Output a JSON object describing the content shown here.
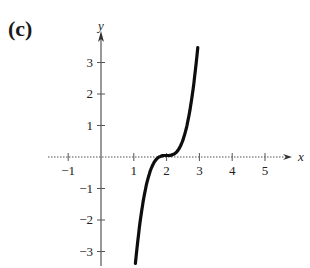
{
  "panel": {
    "label": "(c)"
  },
  "chart_data": {
    "type": "line",
    "title": "",
    "xlabel": "x",
    "ylabel": "y",
    "xlim": [
      -1.2,
      5.8
    ],
    "ylim": [
      -3.4,
      3.6
    ],
    "x_ticks": [
      -1,
      1,
      2,
      3,
      4,
      5
    ],
    "x_tick_labels": [
      "−1",
      "1",
      "2",
      "3",
      "4",
      "5"
    ],
    "y_ticks": [
      -3,
      -2,
      -1,
      1,
      2,
      3
    ],
    "y_tick_labels": [
      "−3",
      "−2",
      "−1",
      "1",
      "2",
      "3"
    ],
    "grid": false,
    "legend": null,
    "series": [
      {
        "name": "f(x) ≈ 4(x − 2)^3",
        "x": [
          1.05,
          1.2,
          1.4,
          1.6,
          1.8,
          1.9,
          2.0,
          2.1,
          2.2,
          2.4,
          2.6,
          2.8,
          2.95
        ],
        "y": [
          -3.43,
          -2.05,
          -0.86,
          -0.26,
          -0.03,
          0.0,
          0.0,
          0.0,
          0.03,
          0.26,
          0.86,
          2.05,
          3.43
        ]
      }
    ]
  },
  "style": {
    "curve_color": "#0d0d0d",
    "axis_color": "#555555"
  }
}
